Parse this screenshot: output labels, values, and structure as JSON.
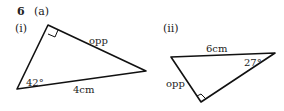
{
  "question": {
    "number": "6",
    "part": "(a)"
  },
  "figures": [
    {
      "label": "(i)",
      "angle_label": "42°",
      "hypotenuse_label": "4cm",
      "side_label": "opp",
      "right_angle": true
    },
    {
      "label": "(ii)",
      "angle_label": "27°",
      "hypotenuse_label": "6cm",
      "side_label": "opp",
      "right_angle": true
    }
  ]
}
